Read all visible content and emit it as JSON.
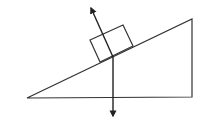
{
  "diagram": {
    "stroke_color": "#222222",
    "background": "#ffffff",
    "incline": {
      "points": [
        [
          27,
          98
        ],
        [
          192,
          19
        ],
        [
          192,
          97
        ]
      ]
    },
    "block": {
      "points": [
        [
          90,
          40
        ],
        [
          123,
          25
        ],
        [
          133,
          46
        ],
        [
          100,
          62
        ]
      ]
    },
    "forces": [
      {
        "name": "normal-force",
        "from": [
          113,
          57
        ],
        "to": [
          91,
          8
        ]
      },
      {
        "name": "gravity-force",
        "from": [
          113,
          57
        ],
        "to": [
          113,
          116
        ]
      }
    ]
  }
}
